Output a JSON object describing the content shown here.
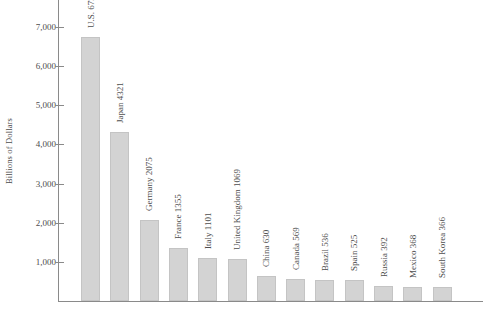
{
  "chart_data": {
    "type": "bar",
    "title": "",
    "subtitle": "",
    "xlabel": "",
    "ylabel": "Billions of Dollars",
    "ylim": [
      0,
      7000
    ],
    "ytick_labels": [
      "1,000",
      "2,000",
      "3,000",
      "4,000",
      "5,000",
      "6,000",
      "7,000"
    ],
    "yticks": [
      1000,
      2000,
      3000,
      4000,
      5000,
      6000,
      7000
    ],
    "grid": false,
    "legend": null,
    "bar_color": "#d3d3d3",
    "categories": [
      "U.S.",
      "Japan",
      "Germany",
      "France",
      "Italy",
      "United Kingdom",
      "China",
      "Canada",
      "Brazil",
      "Spain",
      "Russia",
      "Mexico",
      "South Korea"
    ],
    "values": [
      6737,
      4321,
      2075,
      1355,
      1101,
      1069,
      630,
      569,
      536,
      525,
      392,
      368,
      366
    ],
    "bar_labels": [
      "U.S. 6737",
      "Japan 4321",
      "Germany 2075",
      "France 1355",
      "Italy 1101",
      "United Kingdom 1069",
      "China 630",
      "Canada 569",
      "Brazil 536",
      "Spain 525",
      "Russia 392",
      "Mexico 368",
      "South Korea 366"
    ]
  }
}
